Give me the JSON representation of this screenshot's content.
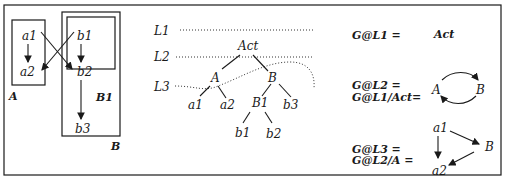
{
  "left_panel": {
    "nodes": {
      "a1": "a1",
      "a2": "a2",
      "b1": "b1",
      "b2": "b2",
      "b3": "b3"
    },
    "box_labels": {
      "A": "A",
      "B1": "B1",
      "B": "B"
    },
    "edges": [
      [
        "a1",
        "a2"
      ],
      [
        "a1",
        "b2"
      ],
      [
        "b1",
        "a2"
      ],
      [
        "b1",
        "b2"
      ],
      [
        "b2",
        "b3"
      ]
    ]
  },
  "tree_panel": {
    "levels": [
      "L1",
      "L2",
      "L3"
    ],
    "nodes": {
      "Act": "Act",
      "A": "A",
      "B": "B",
      "a1": "a1",
      "a2": "a2",
      "B1": "B1",
      "b3": "b3",
      "b1": "b1",
      "b2": "b2"
    },
    "edges": [
      [
        "Act",
        "A"
      ],
      [
        "Act",
        "B"
      ],
      [
        "A",
        "a1"
      ],
      [
        "A",
        "a2"
      ],
      [
        "B",
        "B1"
      ],
      [
        "B",
        "b3"
      ],
      [
        "B1",
        "b1"
      ],
      [
        "B1",
        "b2"
      ]
    ]
  },
  "right_panel": {
    "eq1": {
      "lhs": "G@L1 =",
      "result": "Act"
    },
    "eq2": {
      "lhs1": "G@L2 =",
      "lhs2": "G@L1/Act=",
      "nodes": [
        "A",
        "B"
      ]
    },
    "eq3": {
      "lhs1": "G@L3 =",
      "lhs2": "G@L2/A =",
      "nodes": [
        "a1",
        "B",
        "a2"
      ]
    }
  }
}
